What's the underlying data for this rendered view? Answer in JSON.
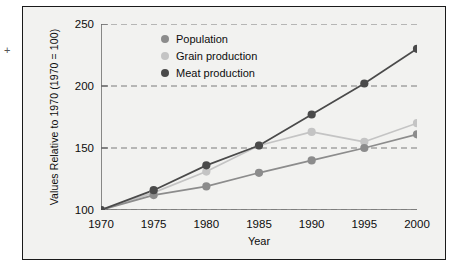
{
  "chart_data": {
    "type": "line",
    "title": "",
    "xlabel": "Year",
    "ylabel": "Values Relative to 1970 (1970 = 100)",
    "x": [
      1970,
      1975,
      1980,
      1985,
      1990,
      1995,
      2000
    ],
    "xticklabels": [
      "1970",
      "1975",
      "1980",
      "1985",
      "1990",
      "1995",
      "2000"
    ],
    "yticklabels": [
      "100",
      "150",
      "200",
      "250"
    ],
    "yticks": [
      100,
      150,
      200,
      250
    ],
    "xlim": [
      1970,
      2000
    ],
    "ylim": [
      100,
      250
    ],
    "grid": "horizontal-dashed",
    "legend_position": "top-center",
    "series": [
      {
        "name": "Population",
        "color": "#8c8c8c",
        "marker": "circle",
        "values": [
          100,
          112,
          119,
          130,
          140,
          150,
          161
        ]
      },
      {
        "name": "Grain production",
        "color": "#c4c4c4",
        "marker": "circle",
        "values": [
          100,
          114,
          131,
          152,
          163,
          155,
          170
        ]
      },
      {
        "name": "Meat production",
        "color": "#4a4a4a",
        "marker": "circle",
        "values": [
          100,
          116,
          136,
          152,
          177,
          202,
          230
        ]
      }
    ]
  },
  "figure": {
    "background_color": "#f2f2f0",
    "border_color": "#1a1a1a",
    "axis_color": "#6b6b6b",
    "gridline_color": "#7a7a7a",
    "text_color": "#0d0d0d",
    "corner_mark": "+"
  }
}
